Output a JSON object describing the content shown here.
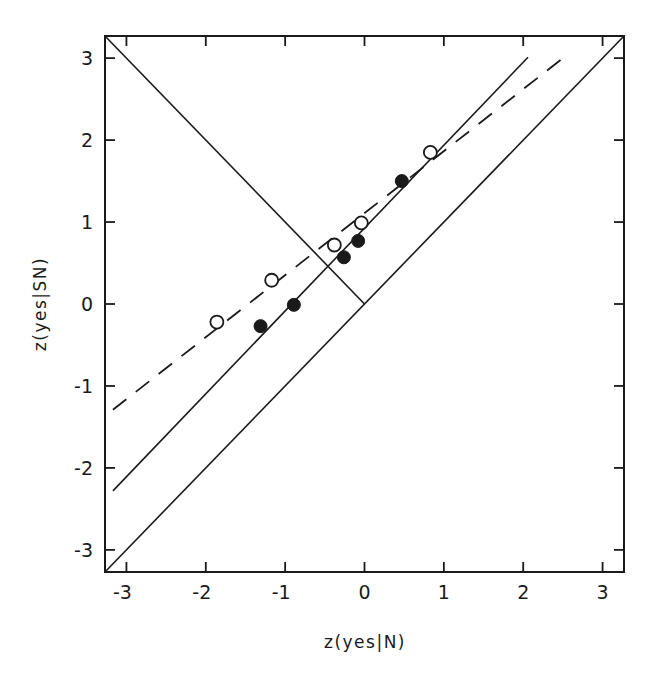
{
  "chart_data": {
    "type": "scatter",
    "title": "",
    "xlabel": "z(yes|N)",
    "ylabel": "z(yes|SN)",
    "xlim": [
      -3.27,
      3.27
    ],
    "ylim": [
      -3.27,
      3.27
    ],
    "grid": false,
    "legend": null,
    "x_ticks": [
      -3,
      -2,
      -1,
      0,
      1,
      2,
      3
    ],
    "y_ticks": [
      -3,
      -2,
      -1,
      0,
      1,
      2,
      3
    ],
    "x_tick_labels": [
      "-3",
      "-2",
      "-1",
      "0",
      "1",
      "2",
      "3"
    ],
    "y_tick_labels": [
      "-3",
      "-2",
      "-1",
      "0",
      "1",
      "2",
      "3"
    ],
    "series": [
      {
        "name": "open circles",
        "marker": "open-circle",
        "points": [
          {
            "x": -1.86,
            "y": -0.22
          },
          {
            "x": -1.17,
            "y": 0.29
          },
          {
            "x": -0.38,
            "y": 0.72
          },
          {
            "x": -0.04,
            "y": 0.99
          },
          {
            "x": 0.83,
            "y": 1.85
          }
        ]
      },
      {
        "name": "filled circles",
        "marker": "filled-circle",
        "points": [
          {
            "x": -1.31,
            "y": -0.27
          },
          {
            "x": -0.89,
            "y": -0.01
          },
          {
            "x": -0.26,
            "y": 0.57
          },
          {
            "x": -0.08,
            "y": 0.77
          },
          {
            "x": 0.47,
            "y": 1.5
          }
        ]
      }
    ],
    "lines": [
      {
        "name": "chance diagonal (y = x)",
        "style": "solid",
        "from": {
          "x": -3.27,
          "y": -3.27
        },
        "to": {
          "x": 3.27,
          "y": 3.27
        }
      },
      {
        "name": "negative diagonal",
        "style": "solid",
        "from": {
          "x": -3.27,
          "y": 3.27
        },
        "to": {
          "x": 0.0,
          "y": 0.0
        }
      },
      {
        "name": "fit to filled circles",
        "style": "solid",
        "slope": 1.01,
        "intercept": 0.93,
        "from": {
          "x": -3.17,
          "y": -2.28
        },
        "to": {
          "x": 2.06,
          "y": 3.01
        }
      },
      {
        "name": "fit to open circles",
        "style": "dashed",
        "slope": 0.76,
        "intercept": 1.11,
        "from": {
          "x": -3.17,
          "y": -1.29
        },
        "to": {
          "x": 2.5,
          "y": 3.0
        }
      }
    ]
  },
  "axes": {
    "xlabel": "z(yes|N)",
    "ylabel": "z(yes|SN)"
  }
}
